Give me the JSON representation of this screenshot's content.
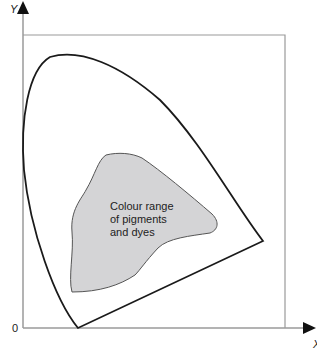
{
  "diagram": {
    "axes": {
      "y_label": "Y",
      "x_label": "X",
      "origin_label": "0"
    },
    "region_label_lines": [
      "Colour range",
      "of pigments",
      "and dyes"
    ],
    "colors": {
      "axis": "#999999",
      "curve": "#1a1a1a",
      "region_fill": "#d4d4d6",
      "region_stroke": "#555555"
    }
  }
}
